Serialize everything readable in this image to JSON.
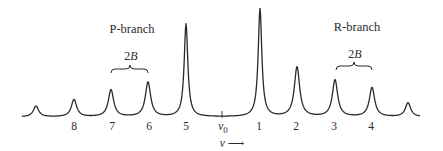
{
  "figure": {
    "branch_labels": {
      "p_branch": "P-branch",
      "r_branch": "R-branch"
    },
    "spacing_label": {
      "coefficient": "2",
      "symbol": "B"
    },
    "center_label": {
      "symbol": "v",
      "subscript": "0"
    },
    "axis_label": {
      "symbol": "v",
      "arrow": "⟶"
    },
    "line_numbers": {
      "p": [
        "8",
        "7",
        "6",
        "5"
      ],
      "r": [
        "1",
        "2",
        "3",
        "4"
      ]
    },
    "colors": {
      "curve": "#2a2a2a",
      "text": "#2a2a2a",
      "background": "#ffffff"
    }
  },
  "chart_data": {
    "type": "line",
    "title": "",
    "xlabel": "v →",
    "ylabel": "",
    "grid": false,
    "legend": "none",
    "annotations": [
      "P-branch",
      "R-branch",
      "2B",
      "2B",
      "v0"
    ],
    "peaks": [
      {
        "label": "",
        "branch": "P",
        "x_px": 36,
        "relative_height": 0.1
      },
      {
        "label": "8",
        "branch": "P",
        "x_px": 74,
        "relative_height": 0.16
      },
      {
        "label": "7",
        "branch": "P",
        "x_px": 111,
        "relative_height": 0.25
      },
      {
        "label": "6",
        "branch": "P",
        "x_px": 148,
        "relative_height": 0.32
      },
      {
        "label": "5",
        "branch": "P",
        "x_px": 186,
        "relative_height": 0.86
      },
      {
        "label": "1",
        "branch": "R",
        "x_px": 260,
        "relative_height": 1.0
      },
      {
        "label": "2",
        "branch": "R",
        "x_px": 297,
        "relative_height": 0.46
      },
      {
        "label": "3",
        "branch": "R",
        "x_px": 335,
        "relative_height": 0.34
      },
      {
        "label": "4",
        "branch": "R",
        "x_px": 372,
        "relative_height": 0.27
      },
      {
        "label": "",
        "branch": "R",
        "x_px": 408,
        "relative_height": 0.13
      }
    ],
    "center": {
      "label": "v0",
      "x_px": 222
    }
  }
}
